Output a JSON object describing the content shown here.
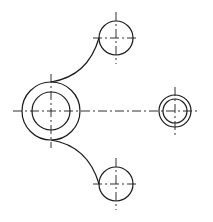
{
  "diagram": {
    "type": "mechanical-2d-drawing",
    "line_color": "#1a1a1a",
    "background": "#ffffff",
    "main_boss": {
      "cx": 51,
      "cy": 111,
      "r_outer": 29,
      "r_inner": 19
    },
    "top_hole": {
      "cx": 116,
      "cy": 38,
      "r": 17
    },
    "bottom_hole": {
      "cx": 116,
      "cy": 184,
      "r": 17
    },
    "right_hole": {
      "cx": 175,
      "cy": 111,
      "r_outer": 16,
      "r_inner": 12
    },
    "horizontal_centerline": {
      "x1": 13,
      "x2": 200,
      "y": 111
    },
    "connecting_arcs": [
      {
        "from": "main_boss_top",
        "to": "top_hole_left"
      },
      {
        "from": "main_boss_bottom",
        "to": "bottom_hole_left"
      }
    ],
    "labels": []
  }
}
